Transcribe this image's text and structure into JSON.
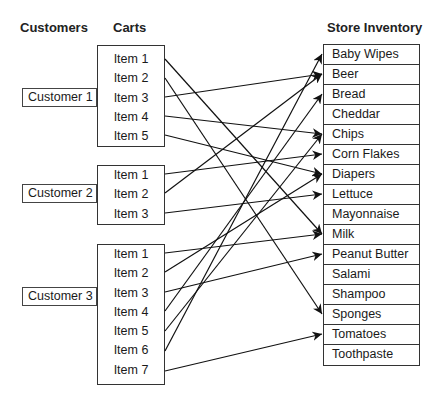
{
  "headers": {
    "customers": "Customers",
    "carts": "Carts",
    "inventory": "Store Inventory"
  },
  "customers": [
    {
      "label": "Customer 1",
      "items": [
        "Item 1",
        "Item 2",
        "Item 3",
        "Item 4",
        "Item 5"
      ]
    },
    {
      "label": "Customer 2",
      "items": [
        "Item 1",
        "Item 2",
        "Item 3"
      ]
    },
    {
      "label": "Customer 3",
      "items": [
        "Item 1",
        "Item 2",
        "Item 3",
        "Item 4",
        "Item 5",
        "Item 6",
        "Item 7"
      ]
    }
  ],
  "inventory": [
    "Baby Wipes",
    "Beer",
    "Bread",
    "Cheddar",
    "Chips",
    "Corn Flakes",
    "Diapers",
    "Lettuce",
    "Mayonnaise",
    "Milk",
    "Peanut Butter",
    "Salami",
    "Shampoo",
    "Sponges",
    "Tomatoes",
    "Toothpaste"
  ],
  "connections": [
    {
      "customer": 0,
      "item": 0,
      "target": "Milk"
    },
    {
      "customer": 0,
      "item": 1,
      "target": "Sponges"
    },
    {
      "customer": 0,
      "item": 2,
      "target": "Beer"
    },
    {
      "customer": 0,
      "item": 3,
      "target": "Chips"
    },
    {
      "customer": 0,
      "item": 4,
      "target": "Diapers"
    },
    {
      "customer": 1,
      "item": 0,
      "target": "Corn Flakes"
    },
    {
      "customer": 1,
      "item": 1,
      "target": "Beer"
    },
    {
      "customer": 1,
      "item": 2,
      "target": "Lettuce"
    },
    {
      "customer": 2,
      "item": 0,
      "target": "Milk"
    },
    {
      "customer": 2,
      "item": 1,
      "target": "Diapers"
    },
    {
      "customer": 2,
      "item": 2,
      "target": "Peanut Butter"
    },
    {
      "customer": 2,
      "item": 3,
      "target": "Bread"
    },
    {
      "customer": 2,
      "item": 4,
      "target": "Chips"
    },
    {
      "customer": 2,
      "item": 5,
      "target": "Baby Wipes"
    },
    {
      "customer": 2,
      "item": 6,
      "target": "Tomatoes"
    }
  ]
}
